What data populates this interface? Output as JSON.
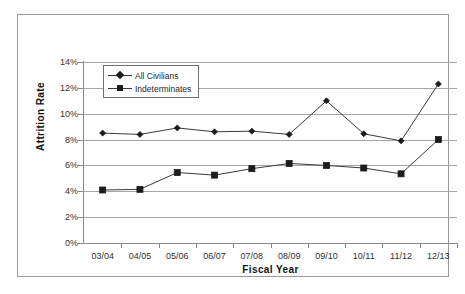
{
  "chart_data": {
    "type": "line",
    "title": "",
    "xlabel": "Fiscal Year",
    "ylabel": "Attrition Rate",
    "categories": [
      "03/04",
      "04/05",
      "05/06",
      "06/07",
      "07/08",
      "08/09",
      "09/10",
      "10/11",
      "11/12",
      "12/13"
    ],
    "ytick_labels": [
      "14%",
      "12%",
      "10%",
      "8%",
      "6%",
      "4%",
      "2%",
      "0%"
    ],
    "ytick_values": [
      14,
      12,
      10,
      8,
      6,
      4,
      2,
      0
    ],
    "ylim": [
      0,
      14
    ],
    "grid": true,
    "legend_position": "upper-left-inside",
    "series": [
      {
        "name": "All Civilians",
        "marker": "diamond",
        "color": "#1c1c1c",
        "values": [
          8.5,
          8.4,
          8.9,
          8.6,
          8.65,
          8.4,
          11.0,
          8.45,
          7.9,
          12.3
        ]
      },
      {
        "name": "Indeterminates",
        "marker": "square",
        "color": "#1c1c1c",
        "values": [
          4.1,
          4.15,
          5.45,
          5.25,
          5.75,
          6.15,
          6.0,
          5.8,
          5.35,
          8.0
        ]
      }
    ]
  }
}
